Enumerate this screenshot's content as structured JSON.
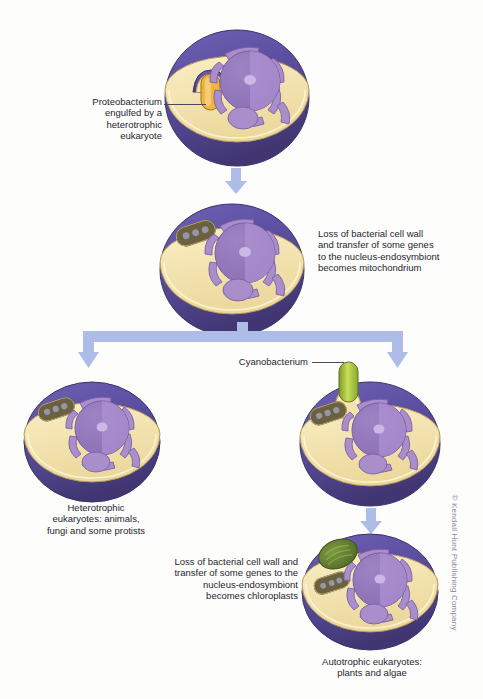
{
  "diagram": {
    "background_color": "#fdfdfc",
    "arrow_color": "#aebde8",
    "palette": {
      "membrane_outer": "#5b4ea0",
      "membrane_dark": "#4a3f8c",
      "cytoplasm": "#f5e3ab",
      "nucleus": "#9b7fc0",
      "nucleus_light": "#c3aede",
      "er": "#a98ecb",
      "proteobacterium": "#f0b440",
      "cyanobacterium": "#b9d64a",
      "mitochondrion": "#6b6040",
      "chloroplast": "#5d7a30",
      "leader_line": "#4a4a55",
      "text": "#26262e"
    }
  },
  "steps": [
    {
      "id": "step-1",
      "cell_name": "heterotrophic-eukaryote-engulfing",
      "label": "Proteobacterium\nengulfed by a\nheterotrophic\neukaryote",
      "label_align": "right",
      "organelles": [
        "nucleus",
        "endoplasmic-reticulum",
        "proteobacterium"
      ]
    },
    {
      "id": "step-2",
      "cell_name": "cell-with-mitochondrion",
      "label": "Loss of bacterial cell wall\nand transfer of some genes\nto the nucleus-endosymbiont\nbecomes mitochondrium",
      "label_align": "left",
      "organelles": [
        "nucleus",
        "endoplasmic-reticulum",
        "mitochondrion"
      ]
    },
    {
      "id": "step-3-left",
      "cell_name": "heterotrophic-eukaryote-final",
      "label": "Heterotrophic\neukaryotes: animals,\nfungi and some protists",
      "label_align": "center",
      "organelles": [
        "nucleus",
        "endoplasmic-reticulum",
        "mitochondrion"
      ]
    },
    {
      "id": "step-3-right",
      "cell_name": "cell-engulfing-cyanobacterium",
      "label": "Cyanobacterium",
      "label_align": "right",
      "organelles": [
        "nucleus",
        "endoplasmic-reticulum",
        "mitochondrion",
        "cyanobacterium"
      ]
    },
    {
      "id": "step-4",
      "cell_name": "autotrophic-eukaryote",
      "label": "Loss of bacterial cell wall and\ntransfer of some genes to the\nnucleus-endosymbiont\nbecomes chloroplasts",
      "label_align": "right",
      "caption": "Autotrophic eukaryotes:\nplants and algae",
      "organelles": [
        "nucleus",
        "endoplasmic-reticulum",
        "mitochondrion",
        "chloroplast"
      ]
    }
  ],
  "credit": "© Kendall Hunt Publishing Company"
}
